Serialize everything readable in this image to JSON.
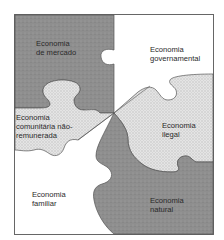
{
  "diagram": {
    "type": "puzzle",
    "colors": {
      "dark_fill": "#8f8f8f",
      "light_dotted_fill": "#e2e2e2",
      "dot_color": "#c4c4c4",
      "white_fill": "#ffffff",
      "outline": "#555555"
    },
    "pieces": [
      {
        "id": "mercado",
        "lines": [
          "Economia",
          "de mercado"
        ],
        "fill": "dark",
        "position": "top-left"
      },
      {
        "id": "governamental",
        "lines": [
          "Economia",
          "governamental"
        ],
        "fill": "white",
        "position": "top-right"
      },
      {
        "id": "comunitaria",
        "lines": [
          "Economia",
          "comunitária não-",
          "remunerada"
        ],
        "fill": "dotted",
        "position": "middle-left"
      },
      {
        "id": "ilegal",
        "lines": [
          "Economia",
          "ilegal"
        ],
        "fill": "dotted",
        "position": "middle-right"
      },
      {
        "id": "familiar",
        "lines": [
          "Economia",
          "familiar"
        ],
        "fill": "white",
        "position": "bottom-left"
      },
      {
        "id": "natural",
        "lines": [
          "Economia",
          "natural"
        ],
        "fill": "dark",
        "position": "bottom-right"
      }
    ]
  }
}
